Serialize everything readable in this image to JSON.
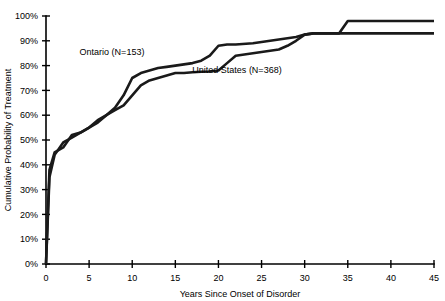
{
  "chart_data": {
    "type": "line",
    "title": "",
    "xlabel": "Years Since Onset of Disorder",
    "ylabel": "Cumulative Probability of Treatment",
    "xlim": [
      0,
      45
    ],
    "ylim": [
      0,
      100
    ],
    "grid": false,
    "legend_position": "inline-annotations",
    "xticks": [
      0,
      5,
      10,
      15,
      20,
      25,
      30,
      35,
      40,
      45
    ],
    "xtick_labels": [
      "0",
      "5",
      "10",
      "15",
      "20",
      "25",
      "30",
      "35",
      "40",
      "45"
    ],
    "yticks": [
      0,
      10,
      20,
      30,
      40,
      50,
      60,
      70,
      80,
      90,
      100
    ],
    "ytick_labels": [
      "0%",
      "10%",
      "20%",
      "30%",
      "40%",
      "50%",
      "60%",
      "70%",
      "80%",
      "90%",
      "100%"
    ],
    "series": [
      {
        "name": "Ontario (N=153)",
        "label": "Ontario (N=153)",
        "n": 153,
        "color": "#1a1a1a",
        "x": [
          0,
          0.4,
          1,
          2,
          3,
          4,
          5,
          6,
          7,
          8,
          9,
          10,
          11,
          12,
          13,
          14,
          15,
          16,
          17,
          18,
          19,
          20,
          21,
          22,
          24,
          26,
          28,
          29,
          30,
          31,
          32,
          33,
          34,
          35,
          40,
          45
        ],
        "y": [
          0,
          38,
          45,
          47,
          52,
          53,
          55,
          57,
          60,
          63,
          68,
          75,
          77,
          78,
          79,
          79.5,
          80,
          80.5,
          81,
          82,
          84,
          88,
          88.5,
          88.5,
          89,
          90,
          91,
          91.5,
          92.5,
          93,
          93,
          93,
          93,
          98,
          98,
          98
        ]
      },
      {
        "name": "United States (N=368)",
        "label": "United States (N=368)",
        "n": 368,
        "color": "#1a1a1a",
        "x": [
          0,
          0.4,
          1,
          2,
          3,
          4,
          5,
          6,
          7,
          8,
          9,
          10,
          11,
          12,
          13,
          14,
          15,
          16,
          17,
          18,
          19,
          20,
          21,
          22,
          23,
          24,
          25,
          26,
          27,
          28,
          29,
          30,
          31,
          32,
          33,
          34,
          35,
          40,
          45
        ],
        "y": [
          0,
          35,
          44,
          49,
          51,
          53,
          55,
          58,
          60,
          62,
          64,
          68,
          72,
          74,
          75,
          76,
          77,
          77,
          77.3,
          77.5,
          77.6,
          78,
          81,
          84,
          84.5,
          85,
          85.5,
          86,
          86.5,
          88,
          90,
          92.5,
          93,
          93,
          93,
          93,
          93,
          93,
          93
        ]
      }
    ],
    "annotations": [
      {
        "text": "Ontario (N=153)",
        "x_px": 112,
        "y_px": 55
      },
      {
        "text": "United States (N=368)",
        "x_px": 237,
        "y_px": 73
      }
    ]
  },
  "plot_geometry": {
    "left_px": 46,
    "right_px": 434,
    "top_px": 16,
    "bottom_px": 264
  }
}
